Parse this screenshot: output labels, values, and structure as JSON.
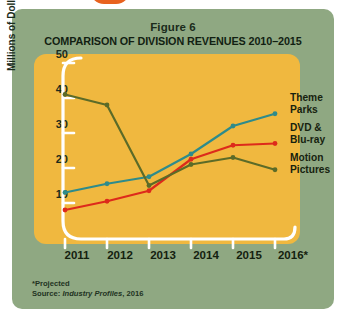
{
  "figure": {
    "number_label": "Figure 6",
    "title": "COMPARISON OF DIVISION REVENUES 2010–2015"
  },
  "footnote": {
    "projected": "*Projected",
    "source_prefix": "Source: ",
    "source_italic": "Industry Profiles",
    "source_suffix": ", 2016"
  },
  "legend": {
    "items": [
      {
        "label_line1": "Theme",
        "label_line2": "Parks",
        "color": "#2e8b8b"
      },
      {
        "label_line1": "DVD &",
        "label_line2": "Blu-ray",
        "color": "#dd2a1b"
      },
      {
        "label_line1": "Motion",
        "label_line2": "Pictures",
        "color": "#5c6b28"
      }
    ]
  },
  "colors": {
    "card_background": "#8fa882",
    "plot_background": "#f0b83f",
    "axis": "#ffffff",
    "theme_parks": "#2e8b8b",
    "dvd_bluray": "#dd2a1b",
    "motion_pictures": "#5c6b28",
    "text": "#16220f",
    "page_background": "#ffffff",
    "top_blob": "#e8621f"
  },
  "chart_data": {
    "type": "line",
    "title": "COMPARISON OF DIVISION REVENUES 2010–2015",
    "subtitle": "Figure 6",
    "xlabel": "",
    "ylabel": "Millions of Dollars",
    "categories": [
      "2011",
      "2012",
      "2013",
      "2014",
      "2015",
      "2016*"
    ],
    "xtick_labels": [
      "2011",
      "2012",
      "2013",
      "2014",
      "2015",
      "2016*"
    ],
    "ytick_labels": [
      "10",
      "20",
      "30",
      "40",
      "50"
    ],
    "yticks": [
      10,
      20,
      30,
      40,
      50
    ],
    "ylim": [
      0,
      52
    ],
    "grid": false,
    "legend_position": "right",
    "series": [
      {
        "name": "Theme Parks",
        "color": "#2e8b8b",
        "values": [
          13,
          15.5,
          17.5,
          24,
          32,
          35.5
        ]
      },
      {
        "name": "DVD & Blu-ray",
        "color": "#dd2a1b",
        "values": [
          8,
          10.5,
          13.5,
          22.5,
          26.5,
          27
        ]
      },
      {
        "name": "Motion Pictures",
        "color": "#5c6b28",
        "values": [
          41,
          38,
          15,
          21,
          23,
          19.5
        ]
      }
    ],
    "annotations": [
      "*Projected",
      "Source: Industry Profiles, 2016"
    ]
  }
}
